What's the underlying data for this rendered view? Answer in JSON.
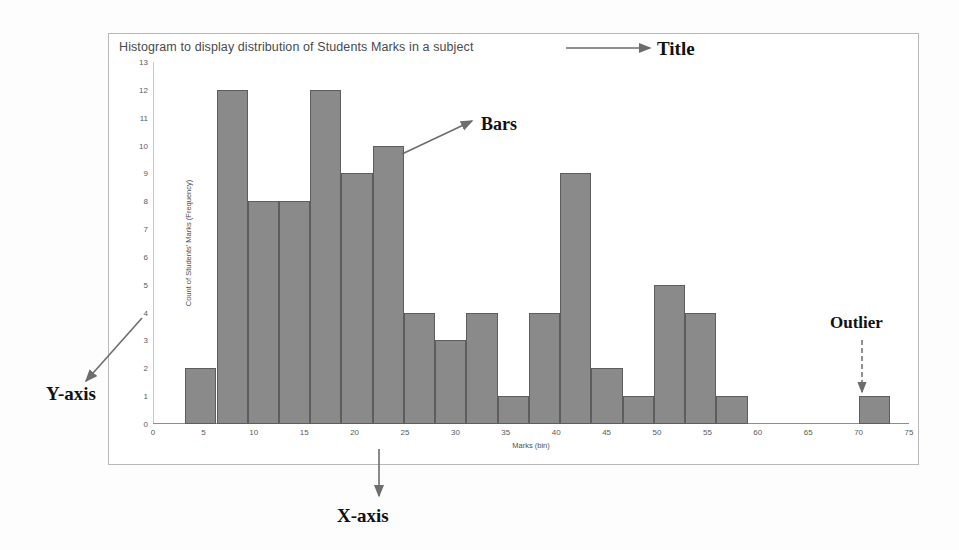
{
  "chart_data": {
    "type": "bar",
    "title": "Histogram to display distribution of Students Marks in a subject",
    "xlabel": "Marks (bin)",
    "ylabel": "Count of Students' Marks (Frequency)",
    "xlim": [
      0,
      75
    ],
    "ylim": [
      0,
      13
    ],
    "xticks": [
      0,
      5,
      10,
      15,
      20,
      25,
      30,
      35,
      40,
      45,
      50,
      55,
      60,
      65,
      70,
      75
    ],
    "yticks": [
      0,
      1,
      2,
      3,
      4,
      5,
      6,
      7,
      8,
      9,
      10,
      11,
      12,
      13
    ],
    "grid": false,
    "legend": "none",
    "bar_color": "#8a8a8a",
    "bar_edge_color": "#5d5d5d",
    "bins": [
      {
        "start": 3.2,
        "end": 6.3,
        "value": 2
      },
      {
        "start": 6.3,
        "end": 9.4,
        "value": 12
      },
      {
        "start": 9.4,
        "end": 12.5,
        "value": 8
      },
      {
        "start": 12.5,
        "end": 15.6,
        "value": 8
      },
      {
        "start": 15.6,
        "end": 18.7,
        "value": 12
      },
      {
        "start": 18.7,
        "end": 21.8,
        "value": 9
      },
      {
        "start": 21.8,
        "end": 24.9,
        "value": 10
      },
      {
        "start": 24.9,
        "end": 28.0,
        "value": 4
      },
      {
        "start": 28.0,
        "end": 31.1,
        "value": 3
      },
      {
        "start": 31.1,
        "end": 34.2,
        "value": 4
      },
      {
        "start": 34.2,
        "end": 37.3,
        "value": 1
      },
      {
        "start": 37.3,
        "end": 40.4,
        "value": 4
      },
      {
        "start": 40.4,
        "end": 43.5,
        "value": 9
      },
      {
        "start": 43.5,
        "end": 46.6,
        "value": 2
      },
      {
        "start": 46.6,
        "end": 49.7,
        "value": 1
      },
      {
        "start": 49.7,
        "end": 52.8,
        "value": 5
      },
      {
        "start": 52.8,
        "end": 55.9,
        "value": 4
      },
      {
        "start": 55.9,
        "end": 59.0,
        "value": 1
      },
      {
        "start": 70.0,
        "end": 73.1,
        "value": 1
      }
    ]
  },
  "annotations": {
    "title_label": "Title",
    "bars_label": "Bars",
    "outlier_label": "Outlier",
    "xaxis_label": "X-axis",
    "yaxis_label": "Y-axis"
  }
}
